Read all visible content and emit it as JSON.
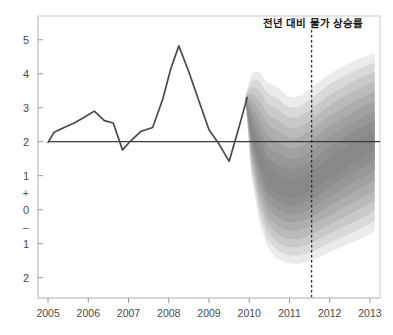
{
  "chart_data": {
    "type": "area",
    "title": "전년 대비 물가 상승률",
    "xlabel": "",
    "ylabel": "",
    "xlim": [
      2004.75,
      2013.25
    ],
    "ylim": [
      -2.6,
      5.7
    ],
    "grid": false,
    "legend_position": "none",
    "x_tick_labels": [
      "2005",
      "2006",
      "2007",
      "2008",
      "2009",
      "2010",
      "2011",
      "2012",
      "2013"
    ],
    "x_tick_values": [
      2005,
      2006,
      2007,
      2008,
      2009,
      2010,
      2011,
      2012,
      2013
    ],
    "y_tick_labels": [
      "5",
      "4",
      "3",
      "2",
      "1",
      "+",
      "0",
      "–",
      "1",
      "2"
    ],
    "y_tick_values": [
      5,
      4,
      3,
      2,
      1,
      0.5,
      0,
      -0.5,
      -1,
      -2
    ],
    "y_sign_markers": [
      {
        "label": "+",
        "value": 0.5
      },
      {
        "label": "–",
        "value": -0.5
      }
    ],
    "reference_line": {
      "value": 2.0,
      "label": "",
      "color": "#3a3a3a"
    },
    "forecast_origin": {
      "value": 2011.55,
      "style": "dashed",
      "color": "#2b2b2b"
    },
    "series": [
      {
        "name": "historical",
        "type": "line",
        "color": "#4a4a4a",
        "x": [
          2005.0,
          2005.15,
          2005.4,
          2005.65,
          2005.9,
          2006.15,
          2006.4,
          2006.62,
          2006.85,
          2007.05,
          2007.3,
          2007.6,
          2007.85,
          2008.05,
          2008.25,
          2008.5,
          2008.75,
          2009.0,
          2009.25,
          2009.5,
          2009.75,
          2009.95
        ],
        "y": [
          1.98,
          2.28,
          2.42,
          2.55,
          2.72,
          2.9,
          2.62,
          2.55,
          1.76,
          2.02,
          2.3,
          2.42,
          3.25,
          4.15,
          4.82,
          4.05,
          3.2,
          2.35,
          1.93,
          1.42,
          2.45,
          3.3
        ]
      }
    ],
    "fan": {
      "name": "forecast-fan",
      "description": "probability bands around central inflation projection",
      "start_x": 2009.9,
      "end_x": 2013.12,
      "band_color_base": "#6f6f6f",
      "bands": [
        {
          "level": 90,
          "opacity": 0.14
        },
        {
          "level": 80,
          "opacity": 0.14
        },
        {
          "level": 70,
          "opacity": 0.15
        },
        {
          "level": 60,
          "opacity": 0.16
        },
        {
          "level": 50,
          "opacity": 0.17
        },
        {
          "level": 40,
          "opacity": 0.18
        },
        {
          "level": 30,
          "opacity": 0.19
        },
        {
          "level": 20,
          "opacity": 0.2
        },
        {
          "level": 10,
          "opacity": 0.21
        }
      ],
      "x": [
        2009.9,
        2010.05,
        2010.25,
        2010.45,
        2010.7,
        2010.95,
        2011.2,
        2011.45,
        2011.7,
        2012.0,
        2012.3,
        2012.6,
        2012.9,
        2013.12
      ],
      "central": [
        3.3,
        2.35,
        1.55,
        0.95,
        0.7,
        0.6,
        0.62,
        0.75,
        0.95,
        1.2,
        1.45,
        1.7,
        1.9,
        2.05
      ],
      "upper_outer": [
        3.32,
        3.95,
        4.05,
        3.75,
        3.6,
        3.35,
        3.32,
        3.5,
        3.72,
        4.0,
        4.2,
        4.38,
        4.52,
        4.62
      ],
      "lower_outer": [
        3.28,
        1.0,
        -0.35,
        -1.1,
        -1.45,
        -1.58,
        -1.6,
        -1.55,
        -1.42,
        -1.25,
        -1.1,
        -0.95,
        -0.78,
        -0.62
      ]
    }
  },
  "axis": {
    "frame_color": "#c9c9c9",
    "tick_color": "#9a9a9a"
  },
  "annotations": {
    "title_text": "전년 대비 물가 상승률"
  }
}
